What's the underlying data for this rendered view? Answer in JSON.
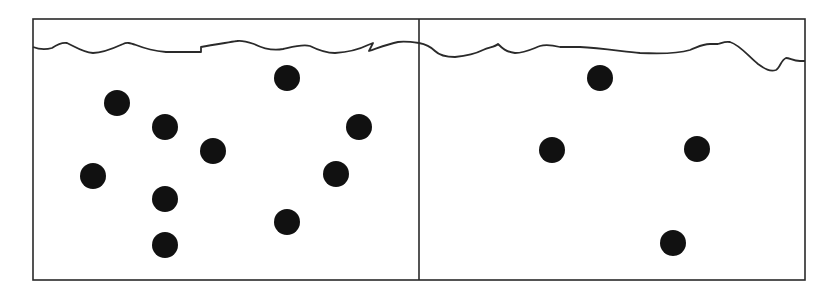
{
  "diagram": {
    "type": "two-panel particle container comparison",
    "colors": {
      "background": "#ffffff",
      "stroke": "#2a2a2a",
      "particle": "#111111"
    },
    "frame": {
      "x": 33,
      "y": 19,
      "width": 772,
      "height": 261
    },
    "divider_x": 419,
    "particle_radius": 13,
    "panels": [
      {
        "id": "left",
        "label": "",
        "particle_count": 10,
        "surface_path": "M33,47 C38,49 45,50 52,48 C58,44 62,42 67,43 C74,46 82,52 93,53 C102,53 112,49 123,44 C127,42 130,43 136,45 C146,49 156,51 166,52 L201,52 L201,47 C212,45 225,43 237,41 C242,40 248,42 254,44 C262,48 272,51 283,49 C292,47 302,44 310,46 C318,50 325,53 335,53 C350,52 362,48 368,45 L373,43 L369,51 C378,48 388,44 398,42 C405,41 412,42 419,43",
        "particles": [
          {
            "cx": 117,
            "cy": 103
          },
          {
            "cx": 165,
            "cy": 127
          },
          {
            "cx": 213,
            "cy": 151
          },
          {
            "cx": 93,
            "cy": 176
          },
          {
            "cx": 165,
            "cy": 199
          },
          {
            "cx": 165,
            "cy": 245
          },
          {
            "cx": 287,
            "cy": 78
          },
          {
            "cx": 359,
            "cy": 127
          },
          {
            "cx": 336,
            "cy": 174
          },
          {
            "cx": 287,
            "cy": 222
          }
        ]
      },
      {
        "id": "right",
        "label": "",
        "particle_count": 4,
        "surface_path": "M419,43 C425,44 430,46 435,51 C440,56 446,57 455,57 C465,56 475,54 483,50 C490,47 495,47 498,44 C502,48 506,52 515,53 C525,53 532,49 540,46 C546,44 552,45 560,47 L580,47 C600,48 620,51 640,53 C660,54 680,53 690,50 C698,47 702,44 710,44 L718,44 C722,43 725,41 730,42 C740,45 748,56 758,64 C765,69 770,72 776,70 C780,68 781,60 786,58 C790,58 793,61 800,61 L805,61",
        "particles": [
          {
            "cx": 600,
            "cy": 78
          },
          {
            "cx": 552,
            "cy": 150
          },
          {
            "cx": 697,
            "cy": 149
          },
          {
            "cx": 673,
            "cy": 243
          }
        ]
      }
    ]
  }
}
